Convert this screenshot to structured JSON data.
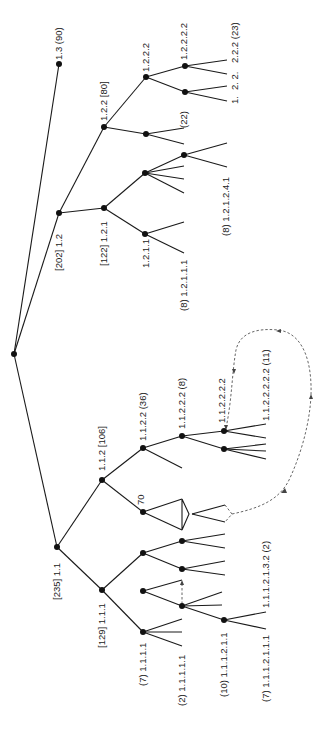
{
  "diagram": {
    "type": "tree",
    "orientation": "rotated-90",
    "colors": {
      "edge": "#1a1a1a",
      "node": "#111111",
      "dashed_link": "#555555",
      "text": "#222222"
    },
    "labels": {
      "n1_3": "1.3 (90)",
      "n1_2": "[202] 1.2",
      "n1_2_1": "[122] 1.2.1",
      "n1_2_1_1": "1.2.1.1",
      "n1_2_1_1_1": "(8) 1.2.1.1.1",
      "n1_2_1_2_4_1": "(8) 1.2.1.2.4.1",
      "n1_2_2": "1.2.2 [80]",
      "n1_2_2_1": "(22)",
      "n1_2_2_2": "1.2.2.2",
      "n1_2_2_2_2": "1.2.2.2.2",
      "n1_2_2_2_leaf_a": "2.2.2 (23)",
      "n1_2_2_2_leaf_b": "2.  2.",
      "n1_2_2_2_leaf_c": "1.",
      "n1_1": "[235] 1.1",
      "n1_1_1": "[129] 1.1.1",
      "n1_1_1_1": "(7) 1.1.1.1",
      "n1_1_1_1_1": "(2) 1.1.1.1.1",
      "n1_1_1_2_1_1": "(10) 1.1.1.2.1.1",
      "n1_1_1_2_1_1_1": "(7) 1.1.1.2.1.1.1",
      "n1_1_1_2_1_3_2": "1.1.1.2.1.3.2 (2)",
      "n1_1_2": "1.1.2 [106]",
      "n1_1_2_1": "70",
      "n1_1_2_2": "1.1.2.2 (36)",
      "n1_1_2_2_2": "1.1.2.2.2 (8)",
      "n1_1_2_2_2_2": "1.1.2.2.2.2",
      "n1_1_2_2_2_2_2": "1.1.2.2.2.2.2 (11)"
    }
  }
}
